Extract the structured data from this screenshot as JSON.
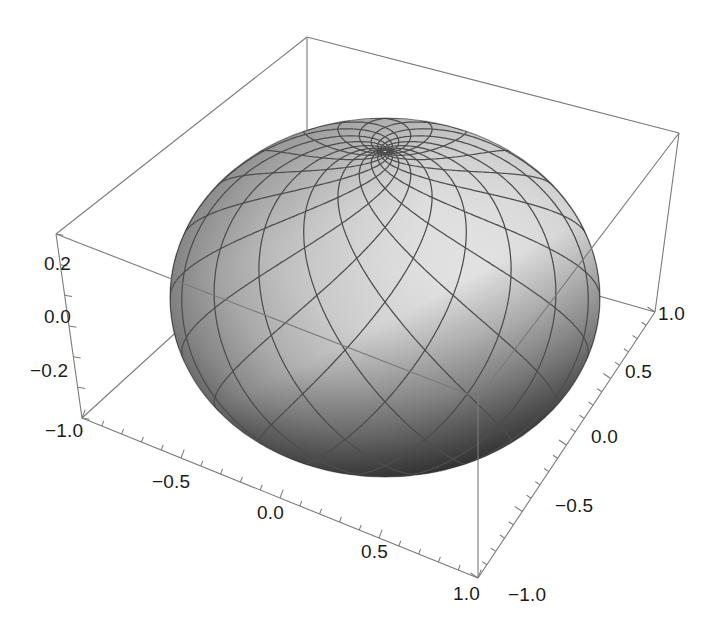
{
  "figure": {
    "kind": "3d-surface-plot",
    "title": "",
    "background_color": "#ffffff",
    "frame_color": "#6f6f6f",
    "tick_color": "#6f6f6f",
    "label_color": "#1b1b1b",
    "width": 704,
    "height": 632
  },
  "chart_data": {
    "type": "scatter",
    "title": "",
    "subtitle": "",
    "render": "3d-parametric-surface",
    "surface": "unit sphere with loxodrome (rhumb-line) spiral mesh converging at the visible pole",
    "xlabel": "",
    "ylabel": "",
    "zlabel": "",
    "grid": false,
    "legend": null,
    "legend_position": "none",
    "axes": [
      {
        "name": "x",
        "position": "front-left-bottom edge",
        "min": -1.0,
        "max": 1.0,
        "ticks": [
          -1.0,
          -0.5,
          0.0,
          0.5,
          1.0
        ],
        "tick_labels": [
          "-1.0",
          "-0.5",
          "0.0",
          "0.5",
          "1.0"
        ],
        "minor_ticks_per_interval": 4
      },
      {
        "name": "y",
        "position": "front-right-bottom edge",
        "min": -1.0,
        "max": 1.0,
        "ticks": [
          -1.0,
          -0.5,
          0.0,
          0.5,
          1.0
        ],
        "tick_labels": [
          "-1.0",
          "-0.5",
          "0.0",
          "0.5",
          "1.0"
        ],
        "minor_ticks_per_interval": 4
      },
      {
        "name": "z",
        "position": "left vertical edge",
        "min": -0.35,
        "max": 0.35,
        "ticks": [
          -0.2,
          0.0,
          0.2
        ],
        "tick_labels": [
          "-0.2",
          "0.0",
          "0.2"
        ],
        "minor_ticks_per_interval": 4
      }
    ],
    "shading": {
      "type": "grayscale-diffuse",
      "highlight_color": "#e9e9e9",
      "midtone_color": "#9a9a9a",
      "shadow_color": "#262626",
      "light_direction": "upper-right"
    },
    "mesh": {
      "line_color": "#4a4a4a",
      "line_width": 1.3,
      "family_a_count": 16,
      "family_b_count": 16,
      "description": "two counter-rotating spiral families forming a diamond lattice"
    },
    "pole_pixel": {
      "x": 385,
      "y": 231
    }
  },
  "axis_labels": {
    "z": [
      {
        "text": "0.2",
        "x": 44,
        "y": 270
      },
      {
        "text": "0.0",
        "x": 44,
        "y": 323
      },
      {
        "text": "-0.2",
        "x": 30,
        "y": 377
      }
    ],
    "x": [
      {
        "text": "-1.0",
        "x": 45,
        "y": 437
      },
      {
        "text": "-0.5",
        "x": 152,
        "y": 488
      },
      {
        "text": "0.0",
        "x": 257,
        "y": 519
      },
      {
        "text": "0.5",
        "x": 361,
        "y": 558
      },
      {
        "text": "1.0",
        "x": 453,
        "y": 600
      }
    ],
    "y": [
      {
        "text": "-1.0",
        "x": 508,
        "y": 601
      },
      {
        "text": "-0.5",
        "x": 555,
        "y": 512
      },
      {
        "text": "0.0",
        "x": 591,
        "y": 443
      },
      {
        "text": "0.5",
        "x": 625,
        "y": 378
      },
      {
        "text": "1.0",
        "x": 658,
        "y": 320
      }
    ]
  }
}
